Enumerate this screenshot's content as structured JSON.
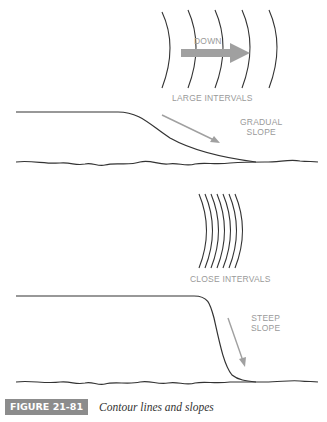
{
  "top_diagram": {
    "arrow_label": "DOWN",
    "interval_label": "LARGE INTERVALS",
    "slope_label_line1": "GRADUAL",
    "slope_label_line2": "SLOPE"
  },
  "bottom_diagram": {
    "interval_label": "CLOSE INTERVALS",
    "slope_label_line1": "STEEP",
    "slope_label_line2": "SLOPE"
  },
  "caption": {
    "figure_number": "FIGURE 21-81",
    "title": "Contour lines and slopes"
  },
  "colors": {
    "line": "#333333",
    "label_gray": "#9a9a9a",
    "arrow_gray": "#a0a0a0",
    "caption_box": "#8c8c8c"
  }
}
